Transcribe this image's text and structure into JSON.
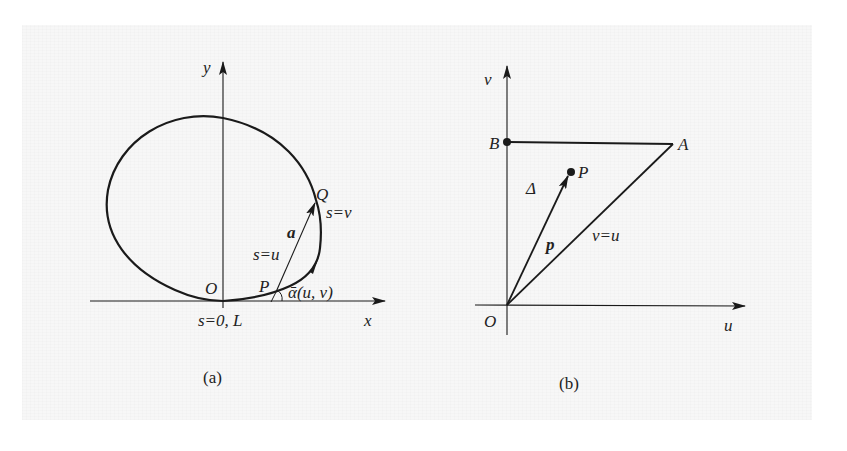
{
  "figure_a": {
    "caption": "(a)",
    "axis_x_label": "x",
    "axis_y_label": "y",
    "origin_label": "O",
    "point_p_label": "P",
    "point_q_label": "Q",
    "vector_label": "a",
    "s_u_label": "s=u",
    "s_v_label": "s=v",
    "s_start_label": "s=0, L",
    "angle_label": "ᾱ(u, v)"
  },
  "figure_b": {
    "caption": "(b)",
    "axis_u_label": "u",
    "axis_v_label": "v",
    "origin_label": "O",
    "point_a_label": "A",
    "point_b_label": "B",
    "point_p_label": "P",
    "region_label": "Δ",
    "vector_label": "p",
    "diagonal_label": "v=u"
  },
  "colors": {
    "ink": "#1a1a1a",
    "paper": "#f7f7f7"
  }
}
